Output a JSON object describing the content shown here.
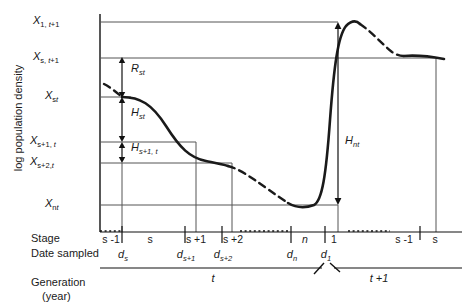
{
  "axes": {
    "y_label": "log population density",
    "row_stage_label": "Stage",
    "row_date_label": "Date sampled",
    "row_generation_label": "Generation",
    "row_generation_sub": "(year)"
  },
  "y_ticks": [
    {
      "name": "x1t1",
      "base": "X",
      "sub": "1, t+1",
      "y": 22
    },
    {
      "name": "xst1",
      "base": "X",
      "sub": "s, t+1",
      "y": 58
    },
    {
      "name": "xst",
      "base": "X",
      "sub": "st",
      "y": 97
    },
    {
      "name": "xs1t",
      "base": "X",
      "sub": "s+1, t",
      "y": 142
    },
    {
      "name": "xs2t",
      "base": "X",
      "sub": "s+2, t",
      "y": 163
    },
    {
      "name": "xnt",
      "base": "X",
      "sub": "nt",
      "y": 205
    }
  ],
  "stages": [
    {
      "label": "s -1",
      "x": 111
    },
    {
      "label": "s",
      "x": 150
    },
    {
      "label": "s +1",
      "x": 196
    },
    {
      "label": "s +2",
      "x": 232
    },
    {
      "label": "n",
      "x": 305
    },
    {
      "label": "1",
      "x": 337
    },
    {
      "label": "s -1",
      "x": 403
    },
    {
      "label": "s",
      "x": 435
    }
  ],
  "dates": [
    {
      "base": "d",
      "sub": "s",
      "x": 122
    },
    {
      "base": "d",
      "sub": "s+1",
      "x": 185
    },
    {
      "base": "d",
      "sub": "s+2",
      "x": 222
    },
    {
      "base": "d",
      "sub": "n",
      "x": 291
    },
    {
      "base": "d",
      "sub": "1",
      "x": 325
    }
  ],
  "generations": [
    {
      "label": "t",
      "x": 213
    },
    {
      "label": "t +1",
      "x": 378
    }
  ],
  "measure_arrows": [
    {
      "name": "R-st",
      "base": "R",
      "sub": "st",
      "x": 131,
      "y": 68
    },
    {
      "name": "H-st",
      "base": "H",
      "sub": "st",
      "x": 131,
      "y": 112
    },
    {
      "name": "H-s1t",
      "base": "H",
      "sub": "s+1, t",
      "x": 131,
      "y": 147
    },
    {
      "name": "H-nt",
      "base": "H",
      "sub": "nt",
      "x": 345,
      "y": 140
    }
  ],
  "colors": {
    "curve": "#1a1a1a",
    "gridline": "#555555",
    "axis": "#111111"
  }
}
